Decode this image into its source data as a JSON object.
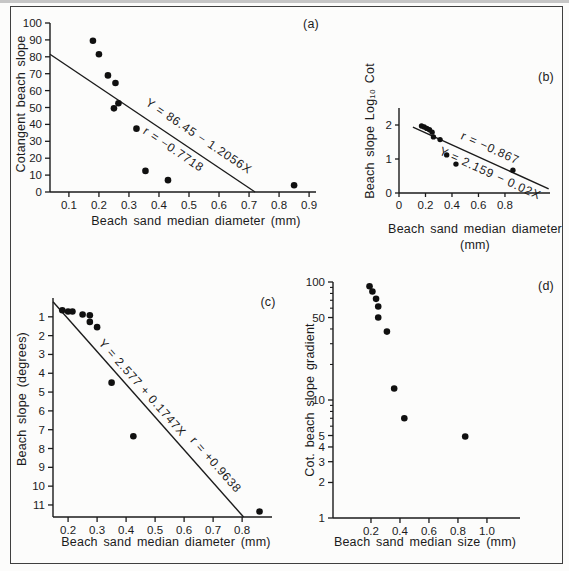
{
  "figure": {
    "background": "#fcfcfb",
    "ink": "#1b1b1b",
    "border_color": "#3f3f3f"
  },
  "chart_data": [
    {
      "id": "a",
      "type": "scatter",
      "panel_label": "(a)",
      "xlabel": "Beach sand median diameter (mm)",
      "ylabel": "Cotangent beach slope",
      "xlim": [
        0.037,
        0.923
      ],
      "ylim": [
        0,
        100
      ],
      "grid": false,
      "xticks": [
        {
          "v": 0.1,
          "label": "0.1"
        },
        {
          "v": 0.2,
          "label": "0.2"
        },
        {
          "v": 0.3,
          "label": "0.3"
        },
        {
          "v": 0.4,
          "label": "0.4"
        },
        {
          "v": 0.5,
          "label": "0.5"
        },
        {
          "v": 0.6,
          "label": "0.6"
        },
        {
          "v": 0.7,
          "label": "0.7"
        },
        {
          "v": 0.8,
          "label": "0.8"
        },
        {
          "v": 0.9,
          "label": "0.9"
        }
      ],
      "yticks": [
        {
          "v": 0,
          "label": "0"
        },
        {
          "v": 10,
          "label": "10"
        },
        {
          "v": 20,
          "label": "20"
        },
        {
          "v": 30,
          "label": "30"
        },
        {
          "v": 40,
          "label": "40"
        },
        {
          "v": 50,
          "label": "50"
        },
        {
          "v": 60,
          "label": "60"
        },
        {
          "v": 70,
          "label": "70"
        },
        {
          "v": 80,
          "label": "80"
        },
        {
          "v": 90,
          "label": "90"
        },
        {
          "v": 100,
          "label": "100"
        }
      ],
      "points": [
        [
          0.18,
          89.5
        ],
        [
          0.2,
          81.5
        ],
        [
          0.23,
          69
        ],
        [
          0.255,
          64.5
        ],
        [
          0.265,
          52.5
        ],
        [
          0.25,
          49.5
        ],
        [
          0.325,
          37.5
        ],
        [
          0.355,
          12.5
        ],
        [
          0.43,
          7
        ],
        [
          0.85,
          4
        ]
      ],
      "fit_line": {
        "x1": 0.037,
        "y1": 81.5,
        "x2": 0.72,
        "y2": 0
      },
      "annotations": [
        {
          "text": "Y = 86.45 − 1.2056X",
          "t": 0.685,
          "offset": -15
        },
        {
          "text": "r = −0.7718",
          "t": 0.63,
          "offset": 10
        }
      ]
    },
    {
      "id": "b",
      "type": "scatter",
      "panel_label": "(b)",
      "xlabel": "Beach sand median diameter",
      "xlabel2": "(mm)",
      "ylabel": "Beach slope Log₁₀ Cot",
      "xlim": [
        0,
        1.14
      ],
      "ylim": [
        0,
        2.5
      ],
      "grid": false,
      "xticks": [
        {
          "v": 0,
          "label": "0"
        },
        {
          "v": 0.2,
          "label": "0.2"
        },
        {
          "v": 0.4,
          "label": "0.4"
        },
        {
          "v": 0.6,
          "label": "0.6"
        },
        {
          "v": 0.8,
          "label": "0.8"
        }
      ],
      "yticks": [
        {
          "v": 0,
          "label": "0"
        },
        {
          "v": 1,
          "label": "1"
        },
        {
          "v": 2,
          "label": "2"
        }
      ],
      "points": [
        [
          0.17,
          1.97
        ],
        [
          0.19,
          1.94
        ],
        [
          0.21,
          1.9
        ],
        [
          0.23,
          1.86
        ],
        [
          0.25,
          1.79
        ],
        [
          0.26,
          1.65
        ],
        [
          0.31,
          1.57
        ],
        [
          0.36,
          1.12
        ],
        [
          0.43,
          0.85
        ],
        [
          0.86,
          0.67
        ]
      ],
      "fit_line": {
        "x1": 0.105,
        "y1": 1.94,
        "x2": 1.13,
        "y2": 0.12
      },
      "annotations": [
        {
          "text": "r = −0.867",
          "t": 0.53,
          "offset": -13
        },
        {
          "text": "Y = 2.159 − 0.02X",
          "t": 0.6,
          "offset": 10
        }
      ]
    },
    {
      "id": "c",
      "type": "scatter",
      "panel_label": "(c)",
      "xlabel": "Beach sand median diameter (mm)",
      "ylabel": "Beach slope (degrees)",
      "xlim": [
        0.148,
        0.903
      ],
      "ylim": [
        0,
        11.64
      ],
      "y_inverted": true,
      "grid": false,
      "xticks": [
        {
          "v": 0.2,
          "label": "0.2"
        },
        {
          "v": 0.3,
          "label": "0.3"
        },
        {
          "v": 0.4,
          "label": "0.4"
        },
        {
          "v": 0.5,
          "label": "0.5"
        },
        {
          "v": 0.6,
          "label": "0.6"
        },
        {
          "v": 0.7,
          "label": "0.7"
        },
        {
          "v": 0.8,
          "label": "0.8"
        }
      ],
      "yticks": [
        {
          "v": 1,
          "label": "1"
        },
        {
          "v": 2,
          "label": "2"
        },
        {
          "v": 3,
          "label": "3"
        },
        {
          "v": 4,
          "label": "4"
        },
        {
          "v": 5,
          "label": "5"
        },
        {
          "v": 6,
          "label": "6"
        },
        {
          "v": 7,
          "label": "7"
        },
        {
          "v": 8,
          "label": "8"
        },
        {
          "v": 9,
          "label": "9"
        },
        {
          "v": 10,
          "label": "10"
        },
        {
          "v": 11,
          "label": "11"
        }
      ],
      "points": [
        [
          0.18,
          0.65
        ],
        [
          0.2,
          0.72
        ],
        [
          0.215,
          0.72
        ],
        [
          0.25,
          0.88
        ],
        [
          0.275,
          0.92
        ],
        [
          0.275,
          1.27
        ],
        [
          0.3,
          1.55
        ],
        [
          0.35,
          4.5
        ],
        [
          0.425,
          7.35
        ],
        [
          0.86,
          11.35
        ]
      ],
      "fit_line": {
        "x1": 0.148,
        "y1": 0.2,
        "x2": 0.805,
        "y2": 11.64
      },
      "annotations": [
        {
          "text": "Y = 2.577 + 0.1747X",
          "t": 0.43,
          "offset": -10
        },
        {
          "text": "r = +0.9638",
          "t": 0.8,
          "offset": -14
        }
      ]
    },
    {
      "id": "d",
      "type": "scatter",
      "panel_label": "(d)",
      "xlabel": "Beach sand median size (mm)",
      "ylabel": "Cot. beach slope gradient",
      "xlim": [
        -0.062,
        1.228
      ],
      "ylim": [
        1,
        100
      ],
      "y_log": true,
      "grid": false,
      "xticks": [
        {
          "v": 0.2,
          "label": "0.2"
        },
        {
          "v": 0.4,
          "label": "0.4"
        },
        {
          "v": 0.6,
          "label": "0.6"
        },
        {
          "v": 0.8,
          "label": "0.8"
        },
        {
          "v": 1.0,
          "label": "1.0"
        }
      ],
      "yticks": [
        {
          "v": 1,
          "label": "1"
        },
        {
          "v": 2,
          "label": "2"
        },
        {
          "v": 3,
          "label": "3"
        },
        {
          "v": 4,
          "label": "4"
        },
        {
          "v": 5,
          "label": "5"
        },
        {
          "v": 10,
          "label": "10"
        },
        {
          "v": 50,
          "label": "50"
        },
        {
          "v": 100,
          "label": "100"
        }
      ],
      "yticks_minor": [
        6,
        7,
        8,
        9,
        20,
        30,
        40,
        60,
        70,
        80,
        90
      ],
      "points": [
        [
          0.19,
          92
        ],
        [
          0.21,
          83
        ],
        [
          0.235,
          72
        ],
        [
          0.25,
          62
        ],
        [
          0.25,
          50
        ],
        [
          0.31,
          38
        ],
        [
          0.36,
          12.5
        ],
        [
          0.43,
          7
        ],
        [
          0.85,
          4.9
        ]
      ]
    }
  ]
}
